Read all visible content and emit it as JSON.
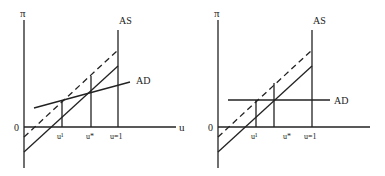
{
  "panels": [
    {
      "id": "left",
      "y_axis_label": "π",
      "x_axis_label": "u",
      "origin_label": "0",
      "as_label": "AS",
      "ad_label": "AD",
      "tick_labels": [
        "u¹",
        "u*",
        "u=1"
      ],
      "ad_shape": "upward-sloping"
    },
    {
      "id": "right",
      "y_axis_label": "π",
      "x_axis_label": "",
      "origin_label": "0",
      "as_label": "AS",
      "ad_label": "AD",
      "tick_labels": [
        "u¹",
        "u*",
        "u=1"
      ],
      "ad_shape": "horizontal"
    }
  ],
  "colors": {
    "line": "#222222",
    "background": "#ffffff"
  }
}
